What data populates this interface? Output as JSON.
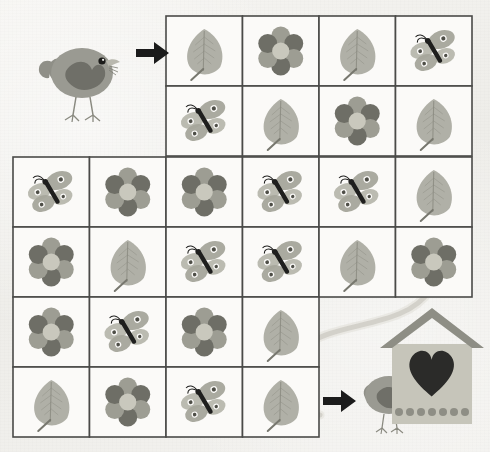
{
  "page": {
    "background_color": "#f2f1ee",
    "grid_line_color": "#4a4a48",
    "path_color": "#cfcdc6"
  },
  "palette": {
    "bird_body": "#9a9a92",
    "bird_wing": "#6f6f68",
    "bird_beak": "#b9b8ae",
    "leaf_fill": "#a9a99f",
    "leaf_vein": "#8a8a80",
    "flower_petal_light": "#9d9d93",
    "flower_petal_dark": "#6e6e66",
    "flower_center": "#c9c8bd",
    "butterfly_wing": "#a5a59b",
    "butterfly_body": "#1f1f1e",
    "butterfly_dot": "#4e4e47",
    "house_body": "#c6c5ba",
    "house_roof": "#8e8e85",
    "house_heart": "#2b2b29",
    "arrow": "#1b1b1b"
  },
  "icons": {
    "leaf": "leaf-icon",
    "flower": "flower-icon",
    "butterfly": "butterfly-icon",
    "bird": "bird-icon",
    "birdhouse": "birdhouse-icon",
    "arrow": "arrow-right-icon",
    "heart": "heart-icon"
  },
  "start_marker": {
    "name": "start-bird",
    "label": "Bird at start",
    "arrow_label": "Start arrow"
  },
  "end_marker": {
    "name": "goal-birdhouse",
    "label": "Heart birdhouse goal",
    "bird_label": "Bird at goal",
    "arrow_label": "Goal arrow"
  },
  "grid": {
    "cell_width": 76.5,
    "cell_height": 70,
    "rows": [
      {
        "index": 0,
        "y": 16,
        "start_col": 2,
        "cells": [
          {
            "col": 2,
            "item": "leaf"
          },
          {
            "col": 3,
            "item": "flower"
          },
          {
            "col": 4,
            "item": "leaf"
          },
          {
            "col": 5,
            "item": "butterfly"
          }
        ]
      },
      {
        "index": 1,
        "y": 86,
        "start_col": 2,
        "cells": [
          {
            "col": 2,
            "item": "butterfly"
          },
          {
            "col": 3,
            "item": "leaf"
          },
          {
            "col": 4,
            "item": "flower"
          },
          {
            "col": 5,
            "item": "leaf"
          }
        ]
      },
      {
        "index": 2,
        "y": 157,
        "start_col": 0,
        "cells": [
          {
            "col": 0,
            "item": "butterfly"
          },
          {
            "col": 1,
            "item": "flower"
          },
          {
            "col": 2,
            "item": "flower"
          },
          {
            "col": 3,
            "item": "butterfly"
          },
          {
            "col": 4,
            "item": "butterfly"
          },
          {
            "col": 5,
            "item": "leaf"
          }
        ]
      },
      {
        "index": 3,
        "y": 227,
        "start_col": 0,
        "cells": [
          {
            "col": 0,
            "item": "flower"
          },
          {
            "col": 1,
            "item": "leaf"
          },
          {
            "col": 2,
            "item": "butterfly"
          },
          {
            "col": 3,
            "item": "butterfly"
          },
          {
            "col": 4,
            "item": "leaf"
          },
          {
            "col": 5,
            "item": "flower"
          }
        ]
      },
      {
        "index": 4,
        "y": 297,
        "start_col": 0,
        "cells": [
          {
            "col": 0,
            "item": "flower"
          },
          {
            "col": 1,
            "item": "butterfly"
          },
          {
            "col": 2,
            "item": "flower"
          },
          {
            "col": 3,
            "item": "leaf"
          }
        ]
      },
      {
        "index": 5,
        "y": 367,
        "start_col": 0,
        "cells": [
          {
            "col": 0,
            "item": "leaf"
          },
          {
            "col": 1,
            "item": "flower"
          },
          {
            "col": 2,
            "item": "butterfly"
          },
          {
            "col": 3,
            "item": "leaf"
          }
        ]
      }
    ]
  }
}
